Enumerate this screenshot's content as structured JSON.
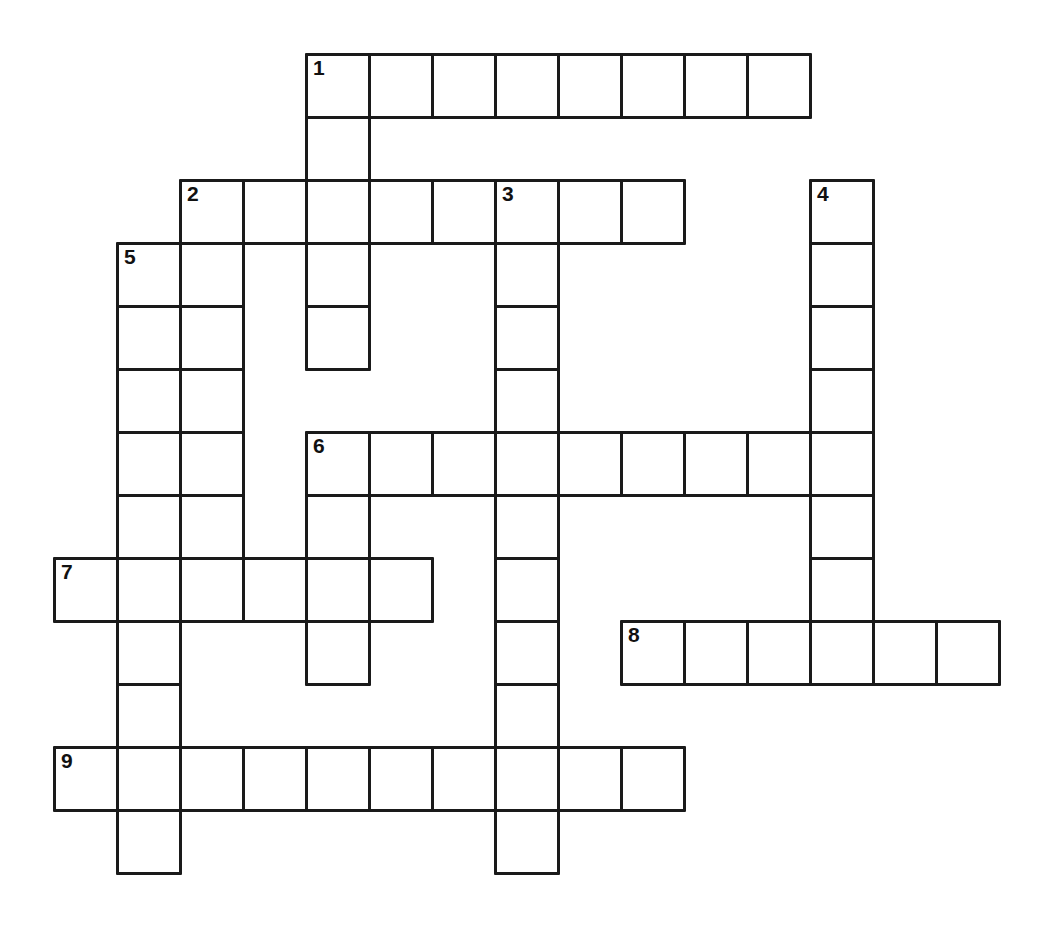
{
  "puzzle": {
    "type": "crossword-grid",
    "title": "",
    "background_color": "#ffffff",
    "line_color": "#1a1a1a",
    "cell_size_px": 63,
    "grid_origin": {
      "x": 53,
      "y": 53
    },
    "columns": 15,
    "rows": 14,
    "numbered_clue_labels": [
      "1",
      "2",
      "3",
      "4",
      "5",
      "6",
      "7",
      "8",
      "9"
    ],
    "entries": [
      {
        "number": "1",
        "direction": "across",
        "row": 0,
        "col": 4,
        "length": 8
      },
      {
        "number": "1",
        "direction": "down",
        "row": 0,
        "col": 4,
        "length": 6
      },
      {
        "number": "2",
        "direction": "across",
        "row": 2,
        "col": 2,
        "length": 8
      },
      {
        "number": "2",
        "direction": "down",
        "row": 2,
        "col": 2,
        "length": 7
      },
      {
        "number": "3",
        "direction": "down",
        "row": 2,
        "col": 7,
        "length": 12
      },
      {
        "number": "4",
        "direction": "down",
        "row": 2,
        "col": 12,
        "length": 7
      },
      {
        "number": "5",
        "direction": "down",
        "row": 3,
        "col": 1,
        "length": 11
      },
      {
        "number": "6",
        "direction": "across",
        "row": 6,
        "col": 4,
        "length": 9
      },
      {
        "number": "7",
        "direction": "across",
        "row": 8,
        "col": 0,
        "length": 6
      },
      {
        "number": "8",
        "direction": "across",
        "row": 9,
        "col": 9,
        "length": 6
      },
      {
        "number": "9",
        "direction": "across",
        "row": 11,
        "col": 0,
        "length": 10
      }
    ],
    "cells": [
      {
        "row": 0,
        "col": 4,
        "number": "1",
        "letter": ""
      },
      {
        "row": 0,
        "col": 5,
        "number": "",
        "letter": ""
      },
      {
        "row": 0,
        "col": 6,
        "number": "",
        "letter": ""
      },
      {
        "row": 0,
        "col": 7,
        "number": "",
        "letter": ""
      },
      {
        "row": 0,
        "col": 8,
        "number": "",
        "letter": ""
      },
      {
        "row": 0,
        "col": 9,
        "number": "",
        "letter": ""
      },
      {
        "row": 0,
        "col": 10,
        "number": "",
        "letter": ""
      },
      {
        "row": 0,
        "col": 11,
        "number": "",
        "letter": ""
      },
      {
        "row": 1,
        "col": 4,
        "number": "",
        "letter": ""
      },
      {
        "row": 2,
        "col": 2,
        "number": "2",
        "letter": ""
      },
      {
        "row": 2,
        "col": 3,
        "number": "",
        "letter": ""
      },
      {
        "row": 2,
        "col": 4,
        "number": "",
        "letter": ""
      },
      {
        "row": 2,
        "col": 5,
        "number": "",
        "letter": ""
      },
      {
        "row": 2,
        "col": 6,
        "number": "",
        "letter": ""
      },
      {
        "row": 2,
        "col": 7,
        "number": "3",
        "letter": ""
      },
      {
        "row": 2,
        "col": 8,
        "number": "",
        "letter": ""
      },
      {
        "row": 2,
        "col": 9,
        "number": "",
        "letter": ""
      },
      {
        "row": 2,
        "col": 12,
        "number": "4",
        "letter": ""
      },
      {
        "row": 3,
        "col": 1,
        "number": "5",
        "letter": ""
      },
      {
        "row": 3,
        "col": 2,
        "number": "",
        "letter": ""
      },
      {
        "row": 3,
        "col": 4,
        "number": "",
        "letter": ""
      },
      {
        "row": 3,
        "col": 7,
        "number": "",
        "letter": ""
      },
      {
        "row": 3,
        "col": 12,
        "number": "",
        "letter": ""
      },
      {
        "row": 4,
        "col": 1,
        "number": "",
        "letter": ""
      },
      {
        "row": 4,
        "col": 2,
        "number": "",
        "letter": ""
      },
      {
        "row": 4,
        "col": 4,
        "number": "",
        "letter": ""
      },
      {
        "row": 4,
        "col": 7,
        "number": "",
        "letter": ""
      },
      {
        "row": 4,
        "col": 12,
        "number": "",
        "letter": ""
      },
      {
        "row": 5,
        "col": 1,
        "number": "",
        "letter": ""
      },
      {
        "row": 5,
        "col": 2,
        "number": "",
        "letter": ""
      },
      {
        "row": 5,
        "col": 7,
        "number": "",
        "letter": ""
      },
      {
        "row": 5,
        "col": 12,
        "number": "",
        "letter": ""
      },
      {
        "row": 6,
        "col": 1,
        "number": "",
        "letter": ""
      },
      {
        "row": 6,
        "col": 2,
        "number": "",
        "letter": ""
      },
      {
        "row": 6,
        "col": 4,
        "number": "6",
        "letter": ""
      },
      {
        "row": 6,
        "col": 5,
        "number": "",
        "letter": ""
      },
      {
        "row": 6,
        "col": 6,
        "number": "",
        "letter": ""
      },
      {
        "row": 6,
        "col": 7,
        "number": "",
        "letter": ""
      },
      {
        "row": 6,
        "col": 8,
        "number": "",
        "letter": ""
      },
      {
        "row": 6,
        "col": 9,
        "number": "",
        "letter": ""
      },
      {
        "row": 6,
        "col": 10,
        "number": "",
        "letter": ""
      },
      {
        "row": 6,
        "col": 11,
        "number": "",
        "letter": ""
      },
      {
        "row": 6,
        "col": 12,
        "number": "",
        "letter": ""
      },
      {
        "row": 7,
        "col": 1,
        "number": "",
        "letter": ""
      },
      {
        "row": 7,
        "col": 2,
        "number": "",
        "letter": ""
      },
      {
        "row": 7,
        "col": 4,
        "number": "",
        "letter": ""
      },
      {
        "row": 7,
        "col": 7,
        "number": "",
        "letter": ""
      },
      {
        "row": 7,
        "col": 12,
        "number": "",
        "letter": ""
      },
      {
        "row": 8,
        "col": 0,
        "number": "7",
        "letter": ""
      },
      {
        "row": 8,
        "col": 1,
        "number": "",
        "letter": ""
      },
      {
        "row": 8,
        "col": 2,
        "number": "",
        "letter": ""
      },
      {
        "row": 8,
        "col": 3,
        "number": "",
        "letter": ""
      },
      {
        "row": 8,
        "col": 4,
        "number": "",
        "letter": ""
      },
      {
        "row": 8,
        "col": 5,
        "number": "",
        "letter": ""
      },
      {
        "row": 8,
        "col": 7,
        "number": "",
        "letter": ""
      },
      {
        "row": 8,
        "col": 12,
        "number": "",
        "letter": ""
      },
      {
        "row": 9,
        "col": 1,
        "number": "",
        "letter": ""
      },
      {
        "row": 9,
        "col": 4,
        "number": "",
        "letter": ""
      },
      {
        "row": 9,
        "col": 7,
        "number": "",
        "letter": ""
      },
      {
        "row": 9,
        "col": 9,
        "number": "8",
        "letter": ""
      },
      {
        "row": 9,
        "col": 10,
        "number": "",
        "letter": ""
      },
      {
        "row": 9,
        "col": 11,
        "number": "",
        "letter": ""
      },
      {
        "row": 9,
        "col": 12,
        "number": "",
        "letter": ""
      },
      {
        "row": 9,
        "col": 13,
        "number": "",
        "letter": ""
      },
      {
        "row": 9,
        "col": 14,
        "number": "",
        "letter": ""
      },
      {
        "row": 10,
        "col": 1,
        "number": "",
        "letter": ""
      },
      {
        "row": 10,
        "col": 7,
        "number": "",
        "letter": ""
      },
      {
        "row": 11,
        "col": 0,
        "number": "9",
        "letter": ""
      },
      {
        "row": 11,
        "col": 1,
        "number": "",
        "letter": ""
      },
      {
        "row": 11,
        "col": 2,
        "number": "",
        "letter": ""
      },
      {
        "row": 11,
        "col": 3,
        "number": "",
        "letter": ""
      },
      {
        "row": 11,
        "col": 4,
        "number": "",
        "letter": ""
      },
      {
        "row": 11,
        "col": 5,
        "number": "",
        "letter": ""
      },
      {
        "row": 11,
        "col": 6,
        "number": "",
        "letter": ""
      },
      {
        "row": 11,
        "col": 7,
        "number": "",
        "letter": ""
      },
      {
        "row": 11,
        "col": 8,
        "number": "",
        "letter": ""
      },
      {
        "row": 11,
        "col": 9,
        "number": "",
        "letter": ""
      },
      {
        "row": 12,
        "col": 1,
        "number": "",
        "letter": ""
      },
      {
        "row": 12,
        "col": 7,
        "number": "",
        "letter": ""
      }
    ]
  }
}
